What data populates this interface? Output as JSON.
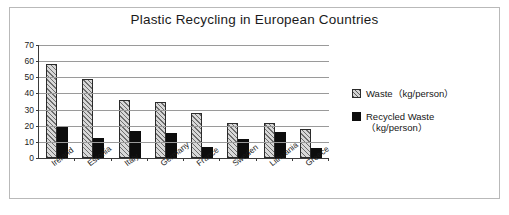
{
  "chart_data": {
    "type": "bar",
    "title": "Plastic Recycling in European Countries",
    "xlabel": "",
    "ylabel": "",
    "ylim": [
      0,
      70
    ],
    "yticks": [
      0,
      10,
      20,
      30,
      40,
      50,
      60,
      70
    ],
    "grid": true,
    "legend_position": "right",
    "categories": [
      "Ireland",
      "Estonia",
      "Italy",
      "Germany",
      "France",
      "Sweden",
      "Lithuania",
      "Greece"
    ],
    "series": [
      {
        "name": "Waste（kg/person）",
        "style": "hatched",
        "color": "#d8d8d8",
        "values": [
          58,
          49,
          36,
          35,
          28,
          22,
          22,
          18
        ]
      },
      {
        "name": "Recycled Waste\n（kg/person）",
        "style": "solid",
        "color": "#0d0d0d",
        "values": [
          20,
          12.5,
          16.5,
          15.5,
          7,
          12,
          16,
          6.5
        ]
      }
    ]
  },
  "legend": {
    "items": [
      {
        "swatch": "hatched-square-icon",
        "label": "Waste（kg/person）"
      },
      {
        "swatch": "filled-square-icon",
        "label": "Recycled Waste\n（kg/person）"
      }
    ]
  }
}
